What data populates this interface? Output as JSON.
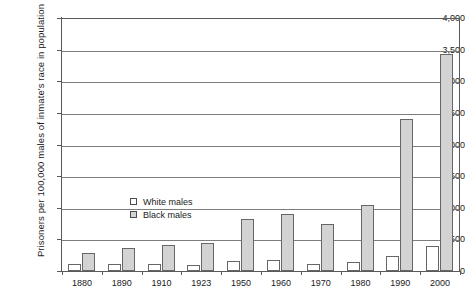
{
  "chart_data": {
    "type": "bar",
    "title": "",
    "subtitle": "",
    "xlabel": "",
    "ylabel": "Prisoners per 100,000 males of inmate's race in population",
    "ylim": [
      0,
      4000
    ],
    "ytick_labels": [
      "0",
      "500",
      "1,000",
      "1,500",
      "2,000",
      "2,500",
      "3,000",
      "3,500",
      "4,000"
    ],
    "ytick_values": [
      0,
      500,
      1000,
      1500,
      2000,
      2500,
      3000,
      3500,
      4000
    ],
    "grid": true,
    "legend_position": "inside-upper-left",
    "categories": [
      "1880",
      "1890",
      "1910",
      "1923",
      "1950",
      "1960",
      "1970",
      "1980",
      "1990",
      "2000"
    ],
    "series": [
      {
        "name": "White males",
        "color": "#ffffff",
        "values": [
          110,
          115,
          110,
          90,
          160,
          170,
          110,
          140,
          240,
          400
        ]
      },
      {
        "name": "Black males",
        "color": "#d3d3d3",
        "values": [
          280,
          370,
          410,
          440,
          820,
          900,
          740,
          1040,
          2400,
          3430
        ]
      }
    ]
  }
}
